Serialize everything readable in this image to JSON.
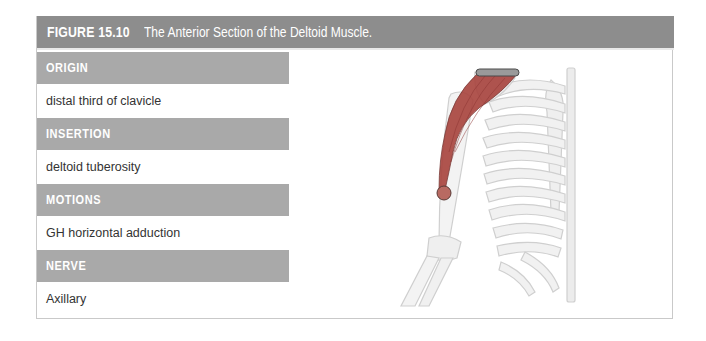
{
  "figure": {
    "number": "FIGURE 15.10",
    "title": "The Anterior Section of the Deltoid Muscle."
  },
  "sections": [
    {
      "heading": "ORIGIN",
      "value": "distal third of clavicle"
    },
    {
      "heading": "INSERTION",
      "value": "deltoid tuberosity"
    },
    {
      "heading": "MOTIONS",
      "value": "GH horizontal adduction"
    },
    {
      "heading": "NERVE",
      "value": "Axillary"
    }
  ],
  "illustration": {
    "subject": "anterior skeleton of right shoulder, arm and rib cage with anterior deltoid highlighted",
    "muscle_color": "#a8433d",
    "origin_marker": "clavicle bar",
    "insertion_marker": "circle at deltoid tuberosity"
  },
  "colors": {
    "header_bg": "#8d8d8d",
    "band_bg": "#a9a9a9",
    "text": "#333333"
  }
}
